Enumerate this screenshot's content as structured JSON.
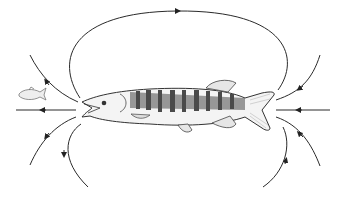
{
  "diagram": {
    "title": "",
    "colors": {
      "line": "#2a2a2a",
      "fish_dark": "#4a4a4a",
      "fish_light": "#d8d8d8",
      "background": "#ffffff"
    },
    "elements": [
      {
        "id": "large-fish",
        "label": ""
      },
      {
        "id": "prey-fish",
        "label": ""
      },
      {
        "id": "flow-lines",
        "count": 9
      }
    ]
  }
}
